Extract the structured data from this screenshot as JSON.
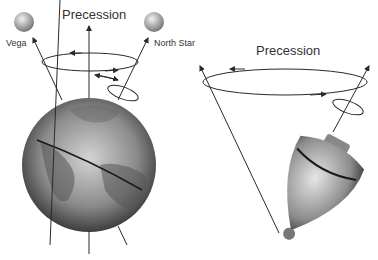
{
  "left_panel": {
    "title": "Precession",
    "star_left": "Vega",
    "star_right": "North Star"
  },
  "right_panel": {
    "title": "Precession"
  },
  "colors": {
    "line": "#2a2a2a",
    "text": "#333333",
    "globe_light": "#d8d8d8",
    "globe_dark": "#2e2e2e"
  }
}
